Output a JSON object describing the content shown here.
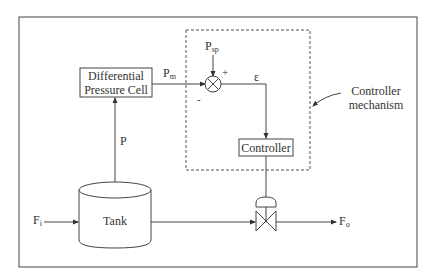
{
  "diagram": {
    "blocks": {
      "dp_cell": {
        "line1": "Differential",
        "line2": "Pressure Cell"
      },
      "controller": {
        "label": "Controller"
      },
      "tank": {
        "label": "Tank"
      }
    },
    "signals": {
      "p_measured": {
        "base": "P",
        "sub": "m"
      },
      "p_setpoint": {
        "base": "P",
        "sub": "sp"
      },
      "error": "ε",
      "pressure": "P",
      "inflow": {
        "base": "F",
        "sub": "i"
      },
      "outflow": {
        "base": "F",
        "sub": "o"
      },
      "plus_sign": "+",
      "minus_sign": "-"
    },
    "annotation": {
      "line1": "Controller",
      "line2": "mechanism"
    },
    "colors": {
      "line": "#333333",
      "dashed": "#555555",
      "background": "#ffffff"
    }
  }
}
